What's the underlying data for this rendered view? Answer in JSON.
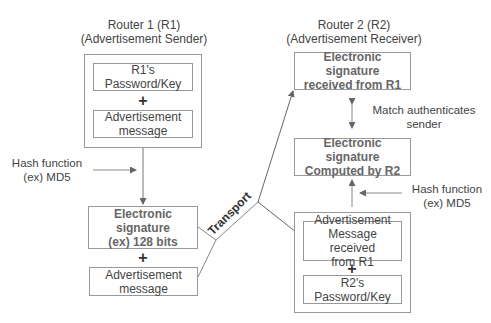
{
  "router1": {
    "title_line1": "Router 1 (R1)",
    "title_line2": "(Advertisement Sender)",
    "key_box": {
      "line1": "R1's",
      "line2": "Password/Key"
    },
    "plus": "+",
    "message_box": {
      "line1": "Advertisement",
      "line2": "message"
    },
    "hash_label": {
      "line1": "Hash function",
      "line2": "(ex) MD5"
    },
    "signature_box": {
      "line1": "Electronic",
      "line2": "signature",
      "line3": "(ex) 128 bits"
    },
    "plus2": "+",
    "message_box2": {
      "line1": "Advertisement",
      "line2": "message"
    }
  },
  "router2": {
    "title_line1": "Router 2 (R2)",
    "title_line2": "(Advertisement Receiver)",
    "received_sig_box": {
      "line1": "Electronic signature",
      "line2": "received from R1"
    },
    "match_label": {
      "line1": "Match authenticates",
      "line2": "sender"
    },
    "computed_sig_box": {
      "line1": "Electronic signature",
      "line2": "Computed by R2"
    },
    "hash_label": {
      "line1": "Hash function",
      "line2": "(ex) MD5"
    },
    "received_msg_box": {
      "line1": "Advertisement",
      "line2": "Message received",
      "line3": "from R1"
    },
    "plus": "+",
    "key_box": {
      "line1": "R2's",
      "line2": "Password/Key"
    }
  },
  "transport_label": "Transport",
  "colors": {
    "line": "#777777",
    "box_border": "#999999",
    "text": "#444444"
  }
}
